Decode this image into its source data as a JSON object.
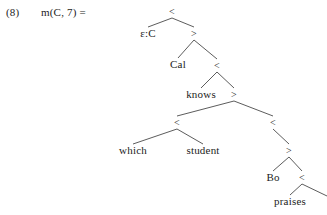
{
  "example": {
    "number": "(8)",
    "formula": "m(C, 7) ="
  },
  "colors": {
    "background": "#ffffff",
    "text": "#1c1c1c",
    "edge": "#4a4a4a"
  },
  "tree": {
    "description": "binary-branching syntactic derivation tree",
    "nodes": [
      {
        "id": "n0",
        "label": "<",
        "x": 172,
        "y": 6,
        "kind": "bracket"
      },
      {
        "id": "n1",
        "label": "ε:C",
        "x": 148,
        "y": 28,
        "kind": "leaf"
      },
      {
        "id": "n2",
        "label": ">",
        "x": 194,
        "y": 28,
        "kind": "bracket"
      },
      {
        "id": "n3",
        "label": "Cal",
        "x": 178,
        "y": 59,
        "kind": "leaf"
      },
      {
        "id": "n4",
        "label": "<",
        "x": 217,
        "y": 60,
        "kind": "bracket"
      },
      {
        "id": "n5",
        "label": "knows",
        "x": 201,
        "y": 89,
        "kind": "leaf"
      },
      {
        "id": "n6",
        "label": ">",
        "x": 234,
        "y": 89,
        "kind": "bracket"
      },
      {
        "id": "n7",
        "label": "<",
        "x": 177,
        "y": 117,
        "kind": "bracket"
      },
      {
        "id": "n8",
        "label": "<",
        "x": 273,
        "y": 117,
        "kind": "bracket"
      },
      {
        "id": "n9",
        "label": "which",
        "x": 133,
        "y": 145,
        "kind": "leaf"
      },
      {
        "id": "n10",
        "label": "student",
        "x": 203,
        "y": 145,
        "kind": "leaf"
      },
      {
        "id": "n11",
        "label": ">",
        "x": 289,
        "y": 145,
        "kind": "bracket"
      },
      {
        "id": "n12",
        "label": "Bo",
        "x": 273,
        "y": 172,
        "kind": "leaf"
      },
      {
        "id": "n13",
        "label": "<",
        "x": 302,
        "y": 172,
        "kind": "bracket"
      },
      {
        "id": "n14",
        "label": "praises",
        "x": 290,
        "y": 196,
        "kind": "leaf"
      }
    ],
    "edges": [
      {
        "from": "n0",
        "to": "n1"
      },
      {
        "from": "n0",
        "to": "n2"
      },
      {
        "from": "n2",
        "to": "n3"
      },
      {
        "from": "n2",
        "to": "n4"
      },
      {
        "from": "n4",
        "to": "n5"
      },
      {
        "from": "n4",
        "to": "n6"
      },
      {
        "from": "n6",
        "to": "n7"
      },
      {
        "from": "n6",
        "to": "n8"
      },
      {
        "from": "n7",
        "to": "n9"
      },
      {
        "from": "n7",
        "to": "n10"
      },
      {
        "from": "n8",
        "to": "n11"
      },
      {
        "from": "n11",
        "to": "n12"
      },
      {
        "from": "n11",
        "to": "n13"
      },
      {
        "from": "n13",
        "to": "n14"
      },
      {
        "from": "n13",
        "to": "clipped-right"
      }
    ],
    "clipped_edge": {
      "note": "rightmost branch runs past the right edge of the image",
      "x1": 306,
      "y1": 181,
      "x2": 327,
      "y2": 196
    }
  }
}
